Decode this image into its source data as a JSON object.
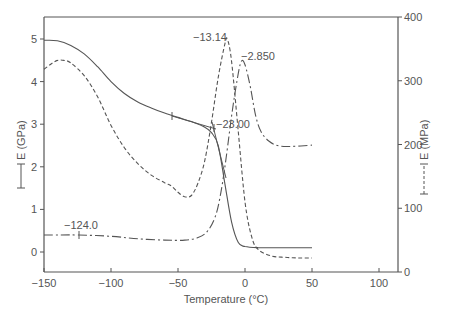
{
  "chart_data": {
    "type": "line",
    "title": "",
    "xlabel": "Temperature (°C)",
    "ylabel_left": "E (GPa)",
    "ylabel_right": "E (MPa)",
    "ylabel_left_legend": "[——]",
    "ylabel_right_legend": "[- - -]",
    "xlim": [
      -150,
      113
    ],
    "ylim_left": [
      -0.47,
      5.5
    ],
    "ylim_right": [
      0,
      400
    ],
    "x_ticks": [
      -150,
      -100,
      -50,
      0,
      50,
      100
    ],
    "y_left_ticks": [
      0,
      1,
      2,
      3,
      4,
      5
    ],
    "y_right_ticks": [
      0,
      100,
      200,
      300,
      400
    ],
    "grid": false,
    "series": [
      {
        "name": "storage modulus E' (GPa)",
        "style": "solid",
        "axis": "left",
        "x": [
          -150,
          -140,
          -130,
          -120,
          -110,
          -100,
          -90,
          -80,
          -70,
          -60,
          -50,
          -40,
          -30,
          -25,
          -20,
          -15,
          -10,
          -5,
          0,
          10,
          20,
          30,
          40,
          50
        ],
        "values": [
          4.97,
          4.96,
          4.85,
          4.65,
          4.35,
          4.0,
          3.72,
          3.52,
          3.38,
          3.26,
          3.16,
          3.06,
          2.93,
          2.8,
          2.5,
          1.6,
          0.7,
          0.22,
          0.13,
          0.1,
          0.1,
          0.1,
          0.1,
          0.1
        ]
      },
      {
        "name": "loss modulus E'' (MPa)",
        "style": "dashed",
        "axis": "right",
        "x": [
          -150,
          -145,
          -140,
          -135,
          -130,
          -120,
          -110,
          -100,
          -90,
          -80,
          -70,
          -60,
          -55,
          -50,
          -45,
          -40,
          -35,
          -30,
          -25,
          -20,
          -15,
          -13.14,
          -10,
          -5,
          0,
          5,
          10,
          20,
          30,
          40,
          50
        ],
        "values": [
          318,
          326,
          332,
          332,
          328,
          308,
          275,
          230,
          195,
          170,
          152,
          140,
          135,
          125,
          118,
          120,
          140,
          175,
          235,
          305,
          358,
          365,
          330,
          220,
          110,
          55,
          35,
          25,
          23,
          22,
          22
        ]
      },
      {
        "name": "tan δ / E (MPa) dash-dot",
        "style": "dashdot",
        "axis": "right",
        "x": [
          -150,
          -140,
          -124,
          -100,
          -80,
          -60,
          -45,
          -35,
          -28,
          -22,
          -18,
          -14,
          -10,
          -6,
          -2.85,
          0,
          4,
          8,
          12,
          18,
          25,
          35,
          50
        ],
        "values": [
          58,
          58,
          58,
          56,
          52,
          50,
          50,
          54,
          64,
          88,
          125,
          180,
          245,
          300,
          330,
          325,
          290,
          245,
          220,
          205,
          198,
          197,
          199
        ]
      }
    ],
    "annotations": [
      {
        "text": "−13.14",
        "x": -13.14,
        "note": "loss modulus peak"
      },
      {
        "text": "−2.850",
        "x": -2.85,
        "note": "dash-dot peak"
      },
      {
        "text": "−23.00",
        "x": -23.0,
        "note": "onset tangent intersection on storage modulus"
      },
      {
        "text": "−124.0",
        "x": -124.0,
        "note": "marker on dash-dot baseline"
      }
    ],
    "tick_text": {
      "x": [
        "−150",
        "−100",
        "−50",
        "0",
        "50",
        "100"
      ],
      "y_left": [
        "0",
        "1",
        "2",
        "3",
        "4",
        "5"
      ],
      "y_right": [
        "0",
        "100",
        "200",
        "300",
        "400"
      ]
    },
    "colors": {
      "axis": "#555555",
      "line": "#555555",
      "background": "#ffffff"
    }
  }
}
